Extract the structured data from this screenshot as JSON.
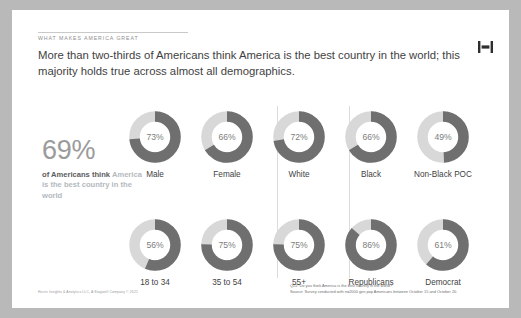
{
  "slide": {
    "eyebrow": "WHAT MAKES AMERICA GREAT",
    "headline": "More than two-thirds of Americans think America is the best country in the world; this majority holds true across almost all demographics.",
    "logo_name": "harris-poll-logo",
    "stat": {
      "number": "69%",
      "caption_lead": "of Americans think ",
      "caption_accent": "America is the best country in the world"
    },
    "source_note_line1": "Q22:  Do you think America is the best country in the world?",
    "source_note_line2": "Source: Survey conducted with n=2000 gen pop Americans between October 15 and October 20.",
    "copyright": "Harris Insights & Analytics LLC, A Stagwell Company © 2021"
  },
  "colors": {
    "filled": "#6f6f6f",
    "track": "#d8d8d8",
    "value_text": "#7d7d7d",
    "label_text": "#3f3f3f",
    "accent_text": "#b3b9be",
    "headline_text": "#3f3f3f",
    "divider": "#dcdcdc",
    "card_background": "#ffffff",
    "page_background": "#b9b9b9"
  },
  "chart_data": {
    "type": "pie",
    "units": "percent",
    "value_range": [
      0,
      100
    ],
    "legend": [
      "Yes — best country in the world"
    ],
    "overall": {
      "label": "All Americans",
      "value": 69,
      "display": "69%"
    },
    "groups": [
      {
        "name": "Gender",
        "row": 0,
        "categories": [
          "Male",
          "Female"
        ],
        "values": [
          73,
          66
        ],
        "displays": [
          "73%",
          "66%"
        ]
      },
      {
        "name": "Race",
        "row": 0,
        "categories": [
          "White",
          "Black",
          "Non-Black POC"
        ],
        "values": [
          72,
          66,
          49
        ],
        "displays": [
          "72%",
          "66%",
          "49%"
        ]
      },
      {
        "name": "Age",
        "row": 1,
        "categories": [
          "18 to 34",
          "35 to 54",
          "55+"
        ],
        "values": [
          56,
          75,
          75
        ],
        "displays": [
          "56%",
          "75%",
          "75%"
        ]
      },
      {
        "name": "Party",
        "row": 1,
        "categories": [
          "Republicans",
          "Democrat"
        ],
        "values": [
          86,
          61
        ],
        "displays": [
          "86%",
          "61%"
        ]
      }
    ],
    "donuts": [
      {
        "label": "Male",
        "value": 73,
        "display": "73%",
        "row": 0,
        "col": 0
      },
      {
        "label": "Female",
        "value": 66,
        "display": "66%",
        "row": 0,
        "col": 1
      },
      {
        "label": "White",
        "value": 72,
        "display": "72%",
        "row": 0,
        "col": 2
      },
      {
        "label": "Black",
        "value": 66,
        "display": "66%",
        "row": 0,
        "col": 3
      },
      {
        "label": "Non-Black POC",
        "value": 49,
        "display": "49%",
        "row": 0,
        "col": 4
      },
      {
        "label": "18 to 34",
        "value": 56,
        "display": "56%",
        "row": 1,
        "col": 0
      },
      {
        "label": "35 to 54",
        "value": 75,
        "display": "75%",
        "row": 1,
        "col": 1
      },
      {
        "label": "55+",
        "value": 75,
        "display": "75%",
        "row": 1,
        "col": 2
      },
      {
        "label": "Republicans",
        "value": 86,
        "display": "86%",
        "row": 1,
        "col": 3
      },
      {
        "label": "Democrat",
        "value": 61,
        "display": "61%",
        "row": 1,
        "col": 4
      }
    ]
  }
}
